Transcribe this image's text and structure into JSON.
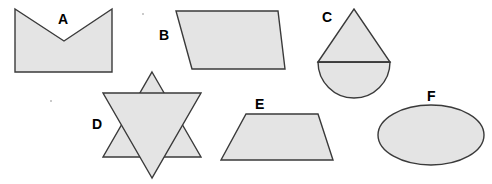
{
  "figure": {
    "background_color": "#ffffff",
    "fill_color": "#e4e4e4",
    "stroke_color": "#3a3a3a",
    "label_color": "#000000",
    "width": 492,
    "height": 184
  },
  "shapes": [
    {
      "label": "A",
      "name": "concave-pentagon",
      "description": "concave pentagon with notched top (chevron / envelope shape)",
      "label_x": 58,
      "label_y": 12,
      "points": "15,9 15,72 112,72 112,9 64,41"
    },
    {
      "label": "B",
      "name": "parallelogram",
      "description": "parallelogram slanting to the right",
      "label_x": 159,
      "label_y": 28,
      "points": "176,11 278,11 285,69 192,69"
    },
    {
      "label": "C",
      "name": "triangle-on-semicircle",
      "description": "triangle sitting on top of a semicircle",
      "label_x": 322,
      "label_y": 10,
      "points": "318,62 354,9 390,62",
      "circle_cx": 354,
      "circle_cy": 62,
      "circle_r": 36,
      "diameter_y": 62
    },
    {
      "label": "D",
      "name": "six-pointed-star",
      "description": "six-pointed star formed by two overlapping triangles",
      "label_x": 92,
      "label_y": 117,
      "triangle_up": "152,72 201,157 103,157",
      "triangle_down": "152,178 103,93 201,93"
    },
    {
      "label": "E",
      "name": "trapezoid",
      "description": "isosceles trapezoid, wider at the bottom",
      "label_x": 255,
      "label_y": 97,
      "points": "246,114 318,114 333,160 221,160"
    },
    {
      "label": "F",
      "name": "ellipse",
      "description": "horizontal ellipse",
      "label_x": 427,
      "label_y": 89,
      "ellipse_cx": 431,
      "ellipse_cy": 135,
      "ellipse_rx": 53,
      "ellipse_ry": 30
    }
  ],
  "specks": [
    {
      "x": 142,
      "y": 13
    },
    {
      "x": 50,
      "y": 100
    }
  ]
}
